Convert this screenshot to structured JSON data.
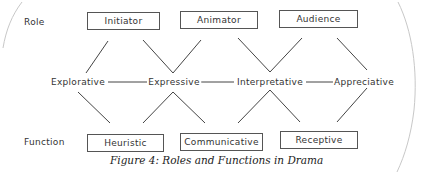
{
  "rows": {
    "role_label": "Role",
    "function_label": "Function"
  },
  "roles": [
    {
      "label": "Initiator"
    },
    {
      "label": "Animator"
    },
    {
      "label": "Audience"
    }
  ],
  "modes": [
    {
      "label": "Explorative"
    },
    {
      "label": "Expressive"
    },
    {
      "label": "Interpretative"
    },
    {
      "label": "Appreciative"
    }
  ],
  "functions": [
    {
      "label": "Heuristic"
    },
    {
      "label": "Communicative"
    },
    {
      "label": "Receptive"
    }
  ],
  "caption": "Figure 4: Roles and Functions in Drama"
}
